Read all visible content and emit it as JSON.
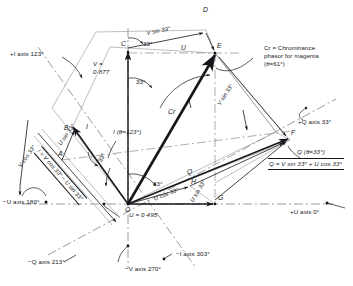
{
  "diagram": {
    "kind": "phasor-vector-diagram",
    "points": {
      "O": "O",
      "A": "A",
      "B": "B",
      "C": "C",
      "D": "D",
      "E": "E",
      "F": "F",
      "G": "G",
      "H": "H"
    },
    "axes": [
      {
        "name": "plus-i-axis",
        "label": "+I axis 123°"
      },
      {
        "name": "plus-q-axis",
        "label": "+Q axis 33°"
      },
      {
        "name": "plus-u-axis",
        "label": "+U axis 0°"
      },
      {
        "name": "minus-u-axis",
        "label": "−U axis 180°"
      },
      {
        "name": "minus-q-axis",
        "label": "−Q axis 213°"
      },
      {
        "name": "minus-v-axis",
        "label": "−V axis 270°"
      },
      {
        "name": "minus-i-axis",
        "label": "−I axis 303°"
      }
    ],
    "angle_marks": [
      {
        "name": "angle-at-c",
        "label": "33°"
      },
      {
        "name": "angle-below-c",
        "label": "33°"
      },
      {
        "name": "angle-at-a",
        "label": "33°"
      },
      {
        "name": "angle-origin-q",
        "label": "33°"
      },
      {
        "name": "angle-origin-i",
        "label": "33°"
      }
    ],
    "vectors": {
      "v_value": "V =\n0·877",
      "u_value": "U = 0·495",
      "u_top": "U",
      "cr_symbol": "Cr",
      "q_symbol": "Q",
      "i_symbol": "I",
      "v_sin33_top": "V sin 33°",
      "v_sin33_left": "V sin 33°",
      "v_sin33_mid": "V sin 33°",
      "u_sin33_left": "U sin 33°",
      "u_sin33_lower": "U sin 33°",
      "u_cos33_mid": "U cos 33°",
      "u_cos33_low": "U cos 33°",
      "v_cos33_left": "V cos 33°"
    },
    "annotations": {
      "cr_callout": "Cr = Chrominance\nphasor for magenta\n(θ=61°)",
      "i_formula_boxed": "I = V cos 33° − U sin 33°",
      "q_formula_boxed": "Q = V sin 33° + U cos 33°",
      "i_theta": "I (θ=123°)",
      "q_theta": "Q (θ=33°)"
    },
    "colors": {
      "ink": "#15161a",
      "construction": "#8d8f94",
      "background": "#ffffff"
    }
  }
}
